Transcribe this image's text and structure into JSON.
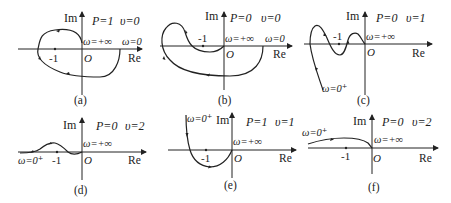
{
  "figure": {
    "panels": [
      {
        "id": "a",
        "caption": "(a)",
        "P_label": "P=1",
        "v_label": "υ=0",
        "im_label": "Im",
        "re_label": "Re",
        "origin_label": "O",
        "minus_one_label": "-1",
        "omega_inf_label": "ω=+∞",
        "omega_start_label": "ω=0"
      },
      {
        "id": "b",
        "caption": "(b)",
        "P_label": "P=0",
        "v_label": "υ=0",
        "im_label": "Im",
        "re_label": "Re",
        "origin_label": "O",
        "minus_one_label": "-1",
        "omega_inf_label": "ω=+∞",
        "omega_start_label": "ω=0"
      },
      {
        "id": "c",
        "caption": "(c)",
        "P_label": "P=0",
        "v_label": "υ=1",
        "im_label": "Im",
        "re_label": "Re",
        "origin_label": "O",
        "minus_one_label": "-1",
        "omega_inf_label": "ω=+∞",
        "omega_start_label": "ω=0⁺"
      },
      {
        "id": "d",
        "caption": "(d)",
        "P_label": "P=0",
        "v_label": "υ=2",
        "im_label": "Im",
        "re_label": "Re",
        "origin_label": "O",
        "minus_one_label": "-1",
        "omega_inf_label": "ω=+∞",
        "omega_start_label": "ω=0⁺"
      },
      {
        "id": "e",
        "caption": "(e)",
        "P_label": "P=1",
        "v_label": "υ=1",
        "im_label": "Im",
        "re_label": "Re",
        "origin_label": "O",
        "minus_one_label": "-1",
        "omega_inf_label": "ω=+∞",
        "omega_start_label": "ω=0⁺"
      },
      {
        "id": "f",
        "caption": "(f)",
        "P_label": "P=0",
        "v_label": "υ=2",
        "im_label": "Im",
        "re_label": "Re",
        "origin_label": "O",
        "minus_one_label": "-1",
        "omega_inf_label": "ω=+∞",
        "omega_start_label": "ω=0⁺"
      }
    ]
  }
}
